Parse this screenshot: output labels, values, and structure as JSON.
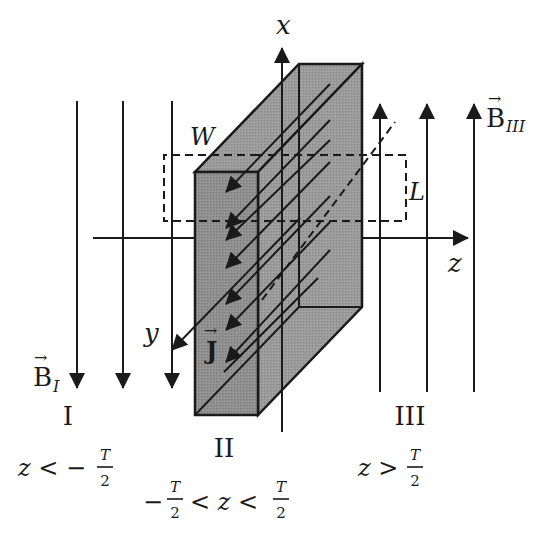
{
  "diagram": {
    "type": "physics-figure",
    "colors": {
      "ink": "#1a1a1a",
      "slab_front": "#8c8c8c",
      "slab_side": "#9a9a9a",
      "slab_top": "#a3a3a3",
      "background": "#ffffff"
    },
    "axes": {
      "x_label": "x",
      "y_label": "y",
      "z_label": "z"
    },
    "slab": {
      "width_label": "W",
      "current_label": "J",
      "current_vector_arrow": "→"
    },
    "loop": {
      "length_label": "L"
    },
    "fields": {
      "left": {
        "symbol": "B",
        "subscript": "I",
        "arrow": "→",
        "direction": "down",
        "count": 3
      },
      "right": {
        "symbol": "B",
        "subscript": "III",
        "arrow": "→",
        "direction": "up",
        "count": 3
      }
    },
    "regions": [
      {
        "numeral": "I",
        "cond_lhs": "z < −",
        "cond_num": "T",
        "cond_den": "2",
        "cond_rhs": ""
      },
      {
        "numeral": "II",
        "cond_lhs": "−",
        "cond_num": "T",
        "cond_den": "2",
        "cond_mid": "< z <",
        "cond_num2": "T",
        "cond_den2": "2"
      },
      {
        "numeral": "III",
        "cond_lhs": "z >",
        "cond_num": "T",
        "cond_den": "2",
        "cond_rhs": ""
      }
    ]
  }
}
